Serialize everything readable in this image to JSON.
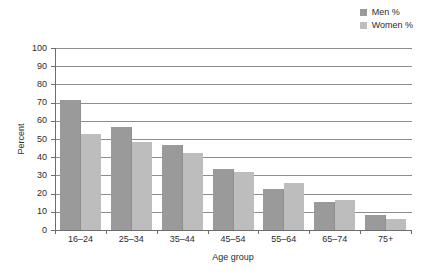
{
  "chart_data": {
    "type": "bar",
    "title": "",
    "xlabel": "Age group",
    "ylabel": "Percent",
    "ylim": [
      0,
      100
    ],
    "ytick_step": 10,
    "yticks": [
      100,
      90,
      80,
      70,
      60,
      50,
      40,
      30,
      20,
      10,
      0
    ],
    "grid": true,
    "legend_position": "top-right",
    "categories": [
      "16–24",
      "25–34",
      "35–44",
      "45–54",
      "55–64",
      "65–74",
      "75+"
    ],
    "series": [
      {
        "name": "Men %",
        "color": "#9a9a9a",
        "values": [
          71.5,
          56.5,
          46.5,
          33.5,
          22.5,
          15.5,
          8
        ]
      },
      {
        "name": "Women %",
        "color": "#bdbdbd",
        "values": [
          53,
          48.5,
          42.5,
          32,
          26,
          16.5,
          6
        ]
      }
    ]
  },
  "legend": {
    "items": [
      {
        "label": "Men %",
        "color": "#9a9a9a"
      },
      {
        "label": "Women %",
        "color": "#bdbdbd"
      }
    ]
  },
  "axes": {
    "y_title": "Percent",
    "x_title": "Age group"
  },
  "colors": {
    "men": "#9a9a9a",
    "women": "#bdbdbd",
    "gridline": "#8d8d8d",
    "axis": "#6d6d6d",
    "text": "#2b2b2b",
    "background": "#ffffff"
  }
}
